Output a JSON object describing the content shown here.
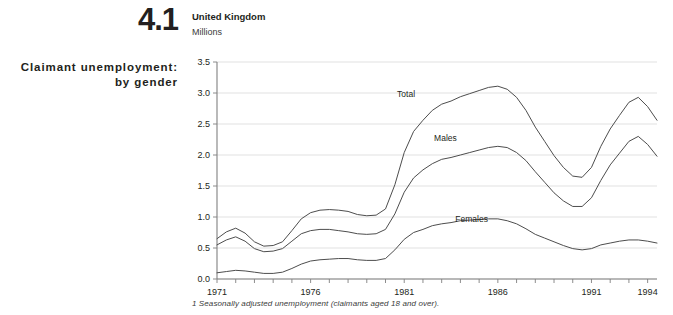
{
  "figure": {
    "number": "4.1",
    "side_title_line1": "Claimant unemployment:",
    "side_title_line2": "by gender"
  },
  "header": {
    "title": "United Kingdom",
    "units": "Millions"
  },
  "footnote": "1 Seasonally adjusted unemployment (claimants aged 18 and over).",
  "chart_data": {
    "type": "line",
    "title": "United Kingdom",
    "subtitle": "Claimant unemployment: by gender",
    "xlabel": "",
    "ylabel": "Millions",
    "ylim": [
      0.0,
      3.5
    ],
    "xlim": [
      1971,
      1994.5
    ],
    "grid": true,
    "legend": "inline-labels",
    "ytick_labels": [
      "0.0",
      "0.5",
      "1.0",
      "1.5",
      "2.0",
      "2.5",
      "3.0",
      "3.5"
    ],
    "ytick_values": [
      0.0,
      0.5,
      1.0,
      1.5,
      2.0,
      2.5,
      3.0,
      3.5
    ],
    "xtick_labels": [
      "1971",
      "1976",
      "1981",
      "1986",
      "1991",
      "1994"
    ],
    "xtick_values": [
      1971,
      1976,
      1981,
      1986,
      1991,
      1994
    ],
    "xtick_minor_step": 1,
    "line_color": "#4d4d4d",
    "grid_color": "#d9d9d9",
    "axis_color": "#808080",
    "x": [
      1971.0,
      1971.5,
      1972.0,
      1972.5,
      1973.0,
      1973.5,
      1974.0,
      1974.5,
      1975.0,
      1975.5,
      1976.0,
      1976.5,
      1977.0,
      1977.5,
      1978.0,
      1978.5,
      1979.0,
      1979.5,
      1980.0,
      1980.5,
      1981.0,
      1981.5,
      1982.0,
      1982.5,
      1983.0,
      1983.5,
      1984.0,
      1984.5,
      1985.0,
      1985.5,
      1986.0,
      1986.5,
      1987.0,
      1987.5,
      1988.0,
      1988.5,
      1989.0,
      1989.5,
      1990.0,
      1990.5,
      1991.0,
      1991.5,
      1992.0,
      1992.5,
      1993.0,
      1993.5,
      1994.0,
      1994.5
    ],
    "series": [
      {
        "name": "Total",
        "label": "Total",
        "label_x": 1981.1,
        "label_y": 2.93,
        "values": [
          0.65,
          0.76,
          0.82,
          0.74,
          0.6,
          0.53,
          0.54,
          0.6,
          0.78,
          0.97,
          1.07,
          1.11,
          1.12,
          1.11,
          1.09,
          1.04,
          1.02,
          1.03,
          1.13,
          1.52,
          2.04,
          2.38,
          2.56,
          2.72,
          2.82,
          2.87,
          2.94,
          2.99,
          3.04,
          3.09,
          3.11,
          3.06,
          2.93,
          2.72,
          2.45,
          2.22,
          1.99,
          1.8,
          1.66,
          1.64,
          1.8,
          2.14,
          2.42,
          2.64,
          2.85,
          2.93,
          2.78,
          2.56
        ]
      },
      {
        "name": "Males",
        "label": "Males",
        "label_x": 1983.2,
        "label_y": 2.22,
        "values": [
          0.55,
          0.63,
          0.68,
          0.61,
          0.49,
          0.44,
          0.45,
          0.49,
          0.61,
          0.73,
          0.78,
          0.8,
          0.8,
          0.78,
          0.76,
          0.73,
          0.72,
          0.73,
          0.8,
          1.05,
          1.4,
          1.63,
          1.76,
          1.86,
          1.93,
          1.96,
          2.0,
          2.04,
          2.08,
          2.12,
          2.14,
          2.12,
          2.04,
          1.91,
          1.73,
          1.56,
          1.39,
          1.26,
          1.17,
          1.17,
          1.31,
          1.59,
          1.84,
          2.03,
          2.22,
          2.3,
          2.17,
          1.98
        ]
      },
      {
        "name": "Females",
        "label": "Females",
        "label_x": 1984.6,
        "label_y": 0.92,
        "values": [
          0.1,
          0.12,
          0.14,
          0.13,
          0.11,
          0.09,
          0.09,
          0.11,
          0.17,
          0.24,
          0.29,
          0.31,
          0.32,
          0.33,
          0.33,
          0.31,
          0.3,
          0.3,
          0.33,
          0.47,
          0.64,
          0.75,
          0.8,
          0.86,
          0.89,
          0.91,
          0.94,
          0.95,
          0.96,
          0.97,
          0.97,
          0.94,
          0.89,
          0.81,
          0.72,
          0.66,
          0.6,
          0.54,
          0.49,
          0.47,
          0.49,
          0.55,
          0.58,
          0.61,
          0.63,
          0.63,
          0.61,
          0.58
        ]
      }
    ]
  }
}
